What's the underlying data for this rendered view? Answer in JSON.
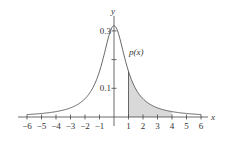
{
  "chart_data": {
    "type": "line",
    "title": "",
    "function_label": "p(x)",
    "xlabel": "x",
    "ylabel": "y",
    "xlim": [
      -6,
      6
    ],
    "ylim": [
      0,
      0.32
    ],
    "x_ticks": [
      -6,
      -5,
      -4,
      -3,
      -2,
      -1,
      1,
      2,
      3,
      4,
      5,
      6
    ],
    "x_tick_labels": [
      "−6",
      "−5",
      "−4",
      "−3",
      "−2",
      "−1",
      "1",
      "2",
      "3",
      "4",
      "5",
      "6"
    ],
    "y_ticks": [
      0.1,
      0.2,
      0.3
    ],
    "y_tick_labels": [
      "0.1",
      "",
      "0.3"
    ],
    "curve": "p(x) = 1/(π(1+x²)) (Cauchy density)",
    "series": [
      {
        "name": "p(x)",
        "x": [
          -6,
          -5,
          -4,
          -3,
          -2,
          -1,
          0,
          1,
          2,
          3,
          4,
          5,
          6
        ],
        "values": [
          0.0086,
          0.0122,
          0.0187,
          0.0318,
          0.0637,
          0.1592,
          0.3183,
          0.1592,
          0.0637,
          0.0318,
          0.0187,
          0.0122,
          0.0086
        ]
      }
    ],
    "shaded_region": {
      "from": 1,
      "to": 4,
      "color": "#d9d9d9"
    },
    "grid": false,
    "legend": "none"
  },
  "colors": {
    "curve": "#555555",
    "axis": "#444444",
    "shade": "#d9d9d9"
  }
}
